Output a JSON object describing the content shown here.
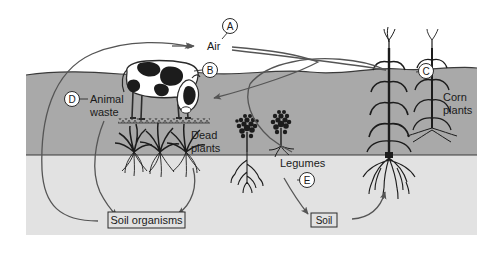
{
  "figure": {
    "type": "labeled-diagram",
    "background_color": "#ffffff"
  },
  "layers": {
    "sky": {
      "name": "Air / sky",
      "color": "#ffffff"
    },
    "topsoil": {
      "name": "Topsoil",
      "color": "#a8a8a8"
    },
    "subsoil": {
      "name": "Subsoil",
      "color": "#e0e0e0"
    }
  },
  "labels": {
    "air": "Air",
    "animal_waste_line1": "Animal",
    "animal_waste_line2": "waste",
    "dead_plants_line1": "Dead",
    "dead_plants_line2": "plants",
    "legumes": "Legumes",
    "corn_plants_line1": "Corn",
    "corn_plants_line2": "plants",
    "soil_organisms": "Soil organisms",
    "soil": "Soil"
  },
  "key_letters": [
    {
      "id": "A",
      "letter": "A",
      "points_to": "Air"
    },
    {
      "id": "B",
      "letter": "B",
      "points_to": "cow"
    },
    {
      "id": "C",
      "letter": "C",
      "points_to": "corn plant"
    },
    {
      "id": "D",
      "letter": "D",
      "points_to": "Animal waste"
    },
    {
      "id": "E",
      "letter": "E",
      "points_to": "Legumes to Soil arrow"
    }
  ],
  "boxed_labels": [
    {
      "id": "soil-organisms",
      "text": "Soil organisms"
    },
    {
      "id": "soil",
      "text": "Soil"
    }
  ],
  "objects": [
    {
      "id": "cow",
      "name": "cow"
    },
    {
      "id": "dead-plants",
      "name": "dead plants"
    },
    {
      "id": "legumes",
      "name": "legume plants"
    },
    {
      "id": "corn-plants",
      "name": "corn plants"
    }
  ],
  "colors": {
    "stroke": "#555555",
    "text": "#1a1a1a",
    "topsoil": "#a8a8a8",
    "subsoil": "#e0e0e0",
    "plant": "#1a1a1a"
  }
}
